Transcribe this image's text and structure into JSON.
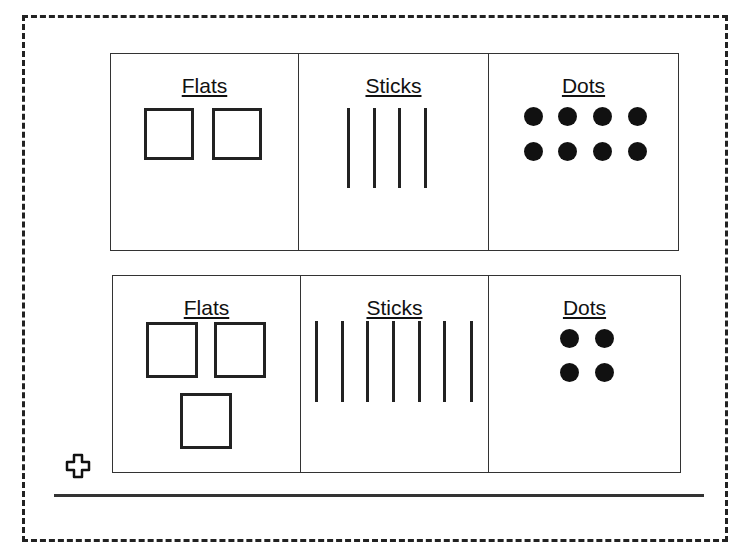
{
  "rows": [
    {
      "columns": [
        {
          "label": "Flats",
          "count": 2
        },
        {
          "label": "Sticks",
          "count": 4
        },
        {
          "label": "Dots",
          "count": 8
        }
      ]
    },
    {
      "columns": [
        {
          "label": "Flats",
          "count": 3
        },
        {
          "label": "Sticks",
          "count": 7
        },
        {
          "label": "Dots",
          "count": 4
        }
      ]
    }
  ],
  "icons": {
    "add": "plus-outline-icon"
  }
}
